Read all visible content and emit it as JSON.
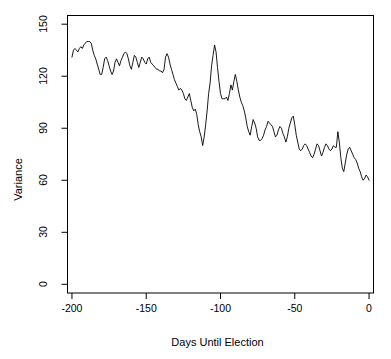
{
  "chart_data": {
    "type": "line",
    "title": "",
    "subtitle": "",
    "xlabel": "Days Until Election",
    "ylabel": "Variance",
    "xlim": [
      -203,
      3
    ],
    "ylim": [
      -5,
      155
    ],
    "xticks": [
      -200,
      -150,
      -100,
      -50,
      0
    ],
    "xticklabels": [
      "-200",
      "-150",
      "-100",
      "-50",
      "0"
    ],
    "yticks": [
      0,
      30,
      60,
      90,
      120,
      150
    ],
    "yticklabels": [
      "0",
      "30",
      "60",
      "90",
      "120",
      "150"
    ],
    "grid": false,
    "legend": null,
    "legend_position": "none",
    "line_color": "#000000",
    "line_width": 0.9,
    "box_color": "#000000",
    "background": "#ffffff",
    "annotations": [],
    "series": [
      {
        "name": "Variance",
        "x": [
          -200,
          -199,
          -198,
          -197,
          -196,
          -195,
          -194,
          -193,
          -192,
          -191,
          -190,
          -189,
          -188,
          -187,
          -186,
          -185,
          -184,
          -183,
          -182,
          -181,
          -180,
          -179,
          -178,
          -177,
          -176,
          -175,
          -174,
          -173,
          -172,
          -171,
          -170,
          -169,
          -168,
          -167,
          -166,
          -165,
          -164,
          -163,
          -162,
          -161,
          -160,
          -159,
          -158,
          -157,
          -156,
          -155,
          -154,
          -153,
          -152,
          -151,
          -150,
          -149,
          -148,
          -147,
          -146,
          -145,
          -144,
          -143,
          -142,
          -141,
          -140,
          -139,
          -138,
          -137,
          -136,
          -135,
          -134,
          -133,
          -132,
          -131,
          -130,
          -129,
          -128,
          -127,
          -126,
          -125,
          -124,
          -123,
          -122,
          -121,
          -120,
          -119,
          -118,
          -117,
          -116,
          -115,
          -114,
          -113,
          -112,
          -111,
          -110,
          -109,
          -108,
          -107,
          -106,
          -105,
          -104,
          -103,
          -102,
          -101,
          -100,
          -99,
          -98,
          -97,
          -96,
          -95,
          -94,
          -93,
          -92,
          -91,
          -90,
          -89,
          -88,
          -87,
          -86,
          -85,
          -84,
          -83,
          -82,
          -81,
          -80,
          -79,
          -78,
          -77,
          -76,
          -75,
          -74,
          -73,
          -72,
          -71,
          -70,
          -69,
          -68,
          -67,
          -66,
          -65,
          -64,
          -63,
          -62,
          -61,
          -60,
          -59,
          -58,
          -57,
          -56,
          -55,
          -54,
          -53,
          -52,
          -51,
          -50,
          -49,
          -48,
          -47,
          -46,
          -45,
          -44,
          -43,
          -42,
          -41,
          -40,
          -39,
          -38,
          -37,
          -36,
          -35,
          -34,
          -33,
          -32,
          -31,
          -30,
          -29,
          -28,
          -27,
          -26,
          -25,
          -24,
          -23,
          -22,
          -21,
          -20,
          -19,
          -18,
          -17,
          -16,
          -15,
          -14,
          -13,
          -12,
          -11,
          -10,
          -9,
          -8,
          -7,
          -6,
          -5,
          -4,
          -3,
          -2,
          -1,
          0
        ],
        "values": [
          131,
          135,
          136,
          135,
          134,
          136,
          137,
          136,
          138,
          139,
          140,
          140,
          140,
          139,
          135,
          132,
          130,
          127,
          124,
          121,
          121,
          125,
          130,
          131,
          129,
          126,
          123,
          121,
          123,
          128,
          130,
          128,
          126,
          129,
          131,
          133,
          134,
          133,
          130,
          126,
          124,
          128,
          132,
          131,
          128,
          125,
          128,
          131,
          130,
          128,
          127,
          130,
          131,
          128,
          127,
          126,
          125,
          124,
          124,
          123,
          123,
          122,
          124,
          131,
          133,
          131,
          127,
          124,
          121,
          118,
          116,
          114,
          112,
          113,
          112,
          110,
          107,
          106,
          108,
          110,
          106,
          102,
          100,
          101,
          98,
          92,
          88,
          85,
          80,
          85,
          92,
          100,
          110,
          116,
          126,
          132,
          138,
          134,
          125,
          117,
          110,
          107,
          107,
          107,
          108,
          106,
          110,
          115,
          112,
          117,
          121,
          117,
          112,
          108,
          105,
          103,
          100,
          96,
          91,
          88,
          86,
          91,
          95,
          93,
          90,
          85,
          83,
          83,
          84,
          86,
          89,
          91,
          94,
          93,
          92,
          91,
          88,
          85,
          86,
          89,
          91,
          90,
          87,
          85,
          82,
          85,
          90,
          93,
          96,
          97,
          92,
          86,
          82,
          78,
          77,
          78,
          80,
          81,
          80,
          78,
          76,
          74,
          73,
          75,
          78,
          81,
          80,
          77,
          74,
          76,
          79,
          81,
          80,
          78,
          77,
          78,
          80,
          79,
          79,
          88,
          82,
          73,
          67,
          65,
          70,
          75,
          78,
          79,
          77,
          75,
          73,
          72,
          70,
          67,
          65,
          62,
          60,
          61,
          63,
          62,
          60
        ]
      }
    ]
  },
  "axes": {
    "x_title": "Days Until Election",
    "y_title": "Variance",
    "x_tick_labels": [
      "-200",
      "-150",
      "-100",
      "-50",
      "0"
    ],
    "y_tick_labels": [
      "0",
      "30",
      "60",
      "90",
      "120",
      "150"
    ]
  }
}
